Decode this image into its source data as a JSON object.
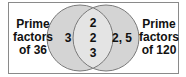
{
  "diagram": {
    "type": "venn",
    "left_set": {
      "label_lines": [
        "Prime",
        "factors",
        "of 36"
      ],
      "only": "3"
    },
    "right_set": {
      "label_lines": [
        "Prime",
        "factors",
        "of 120"
      ],
      "only": "2, 5"
    },
    "intersection": [
      "2",
      "2",
      "3"
    ],
    "colors": {
      "circle_fill": "#d4d4d4",
      "overlap_fill": "#e4e4e4",
      "stroke": "#7a7a7a",
      "border": "#8a8a8a"
    }
  }
}
